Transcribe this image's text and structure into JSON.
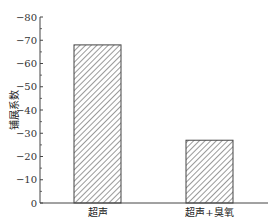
{
  "chart_data": {
    "type": "bar",
    "title": "",
    "xlabel": "",
    "ylabel": "铺展系数",
    "categories": [
      "超声",
      "超声+臭氧"
    ],
    "values": [
      -68,
      -27
    ],
    "ylim": [
      0,
      -80
    ],
    "y_inverted": true,
    "yticks": [
      0,
      -10,
      -20,
      -30,
      -40,
      -50,
      -60,
      -70,
      -80
    ],
    "grid": false,
    "legend": null,
    "bar_style": "diagonal-hatch",
    "colors": {
      "bar_fill": "#ffffff",
      "hatch": "#555555",
      "axis": "#444444",
      "text": "#222222"
    }
  }
}
